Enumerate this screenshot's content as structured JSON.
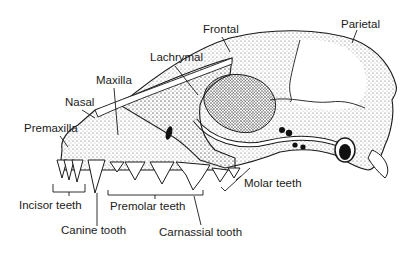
{
  "diagram": {
    "colors": {
      "ink": "#1a1a1a",
      "background": "#ffffff",
      "stipple": "#555555"
    },
    "labels": [
      {
        "id": "frontal",
        "text": "Frontal",
        "x": 203,
        "y": 24
      },
      {
        "id": "parietal",
        "text": "Parietal",
        "x": 341,
        "y": 19
      },
      {
        "id": "lachrymal",
        "text": "Lachrymal",
        "x": 150,
        "y": 52
      },
      {
        "id": "maxilla",
        "text": "Maxilla",
        "x": 96,
        "y": 75
      },
      {
        "id": "nasal",
        "text": "Nasal",
        "x": 65,
        "y": 97
      },
      {
        "id": "premaxilla",
        "text": "Premaxilla",
        "x": 24,
        "y": 123
      },
      {
        "id": "incisor",
        "text": "Incisor teeth",
        "x": 19,
        "y": 200
      },
      {
        "id": "premolar",
        "text": "Premolar teeth",
        "x": 110,
        "y": 201
      },
      {
        "id": "molar",
        "text": "Molar teeth",
        "x": 244,
        "y": 178
      },
      {
        "id": "canine",
        "text": "Canine tooth",
        "x": 61,
        "y": 225
      },
      {
        "id": "carnassial",
        "text": "Carnassial tooth",
        "x": 159,
        "y": 227
      }
    ]
  }
}
